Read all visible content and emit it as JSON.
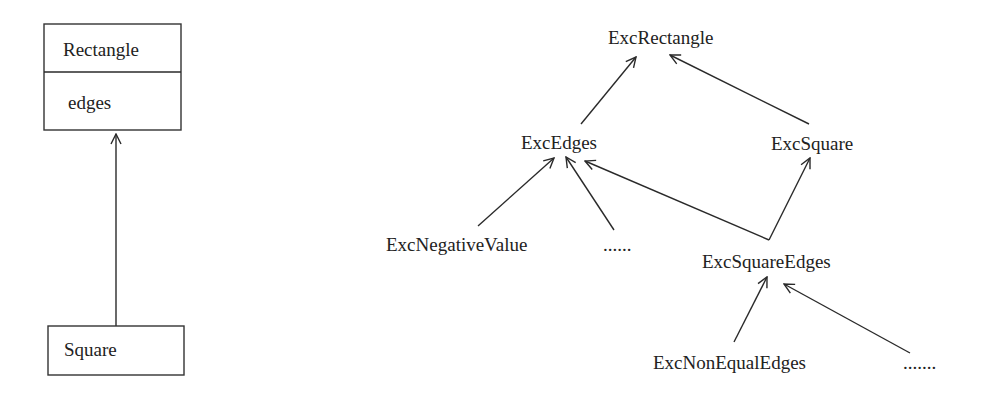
{
  "uml_diagram": {
    "classes": [
      {
        "name": "Rectangle",
        "attributes": [
          "edges"
        ]
      },
      {
        "name": "Square",
        "attributes": []
      }
    ],
    "relations": [
      {
        "from": "Square",
        "to": "Rectangle",
        "type": "inheritance"
      }
    ]
  },
  "exception_hierarchy": {
    "nodes": {
      "exc_rectangle": "ExcRectangle",
      "exc_edges": "ExcEdges",
      "exc_square": "ExcSquare",
      "exc_negative_value": "ExcNegativeValue",
      "exc_edges_more": "......",
      "exc_square_edges": "ExcSquareEdges",
      "exc_non_equal_edges": "ExcNonEqualEdges",
      "exc_square_edges_more": "......."
    },
    "edges": [
      {
        "from": "ExcEdges",
        "to": "ExcRectangle"
      },
      {
        "from": "ExcSquare",
        "to": "ExcRectangle"
      },
      {
        "from": "ExcNegativeValue",
        "to": "ExcEdges"
      },
      {
        "from": "......",
        "to": "ExcEdges"
      },
      {
        "from": "ExcSquareEdges",
        "to": "ExcEdges"
      },
      {
        "from": "ExcSquareEdges",
        "to": "ExcSquare"
      },
      {
        "from": "ExcNonEqualEdges",
        "to": "ExcSquareEdges"
      },
      {
        "from": ".......",
        "to": "ExcSquareEdges"
      }
    ]
  },
  "labels": {
    "rectangle_class": "Rectangle",
    "rectangle_attr": "edges",
    "square_class": "Square"
  }
}
